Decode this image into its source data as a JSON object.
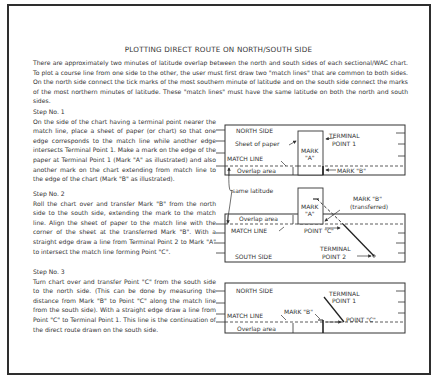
{
  "title": "PLOTTING DIRECT ROUTE ON NORTH/SOUTH SIDE",
  "intro": "There are approximately two minutes of latitude overlap between the north and south sides of each sectional/WAC chart. To plot a course line from one side to the other, the user must first draw two \"match lines\" that are common to both sides. On the north side connect the tick marks of the most southern minute of latitude and on the south side connect the marks of the most northern minutes of latitude. These \"match lines\" must have the same latitude on both the north and south sides.",
  "steps": [
    {
      "heading": "Step No. 1",
      "text": "On the side of the chart having a terminal point nearer the match line, place a sheet of paper (or chart) so that one edge corresponds to the match line while another edge intersects Terminal Point 1. Make a mark on the edge of the paper at Terminal Point 1 (Mark \"A\" as illustrated) and also another mark on the chart extending from match line to the edge of the chart (Mark \"B\" as illustrated)."
    },
    {
      "heading": "Step No. 2",
      "text": "Roll the chart over and transfer Mark \"B\" from the north side to the south side, extending the mark to the match line. Align the sheet of paper to the match line with the corner of the sheet at the transferred Mark \"B\". With a straight edge draw a line from Terminal Point 2 to Mark \"A\" to intersect the match line forming Point \"C\"."
    },
    {
      "heading": "Step No. 3",
      "text": "Turn chart over and transfer Point \"C\" from the south side to the north side. (This can be done by measuring the distance from Mark \"B\" to Point \"C\" along the match line from the south side). With a straight edge draw a line from Point \"C\" to Terminal Point 1. This line is the continuation of the direct route drawn on the south side."
    }
  ],
  "diagrams": {
    "d1": {
      "north_side": "NORTH SIDE",
      "sheet_of_paper": "Sheet of paper",
      "mark_a_line1": "MARK",
      "mark_a_line2": "\"A\"",
      "terminal_1_line1": "TERMINAL",
      "terminal_1_line2": "POINT 1",
      "match_line": "MATCH LINE",
      "overlap_area": "Overlap area",
      "mark_b": "MARK \"B\""
    },
    "same_latitude": "same latitude",
    "d2": {
      "mark_a_line1": "MARK",
      "mark_a_line2": "\"A\"",
      "mark_b_line1": "MARK \"B\"",
      "mark_b_line2": "(transferred)",
      "overlap_area": "Overlap area",
      "match_line": "MATCH LINE",
      "point_c": "POINT \"C\"",
      "south_side": "SOUTH SIDE",
      "terminal_2_line1": "TERMINAL",
      "terminal_2_line2": "POINT 2"
    },
    "d3": {
      "north_side": "NORTH SIDE",
      "terminal_1_line1": "TERMINAL",
      "terminal_1_line2": "POINT 1",
      "match_line": "MATCH LINE",
      "mark_b": "MARK \"B\"",
      "point_c": "POINT \"C\"",
      "overlap_area": "Overlap area"
    }
  }
}
